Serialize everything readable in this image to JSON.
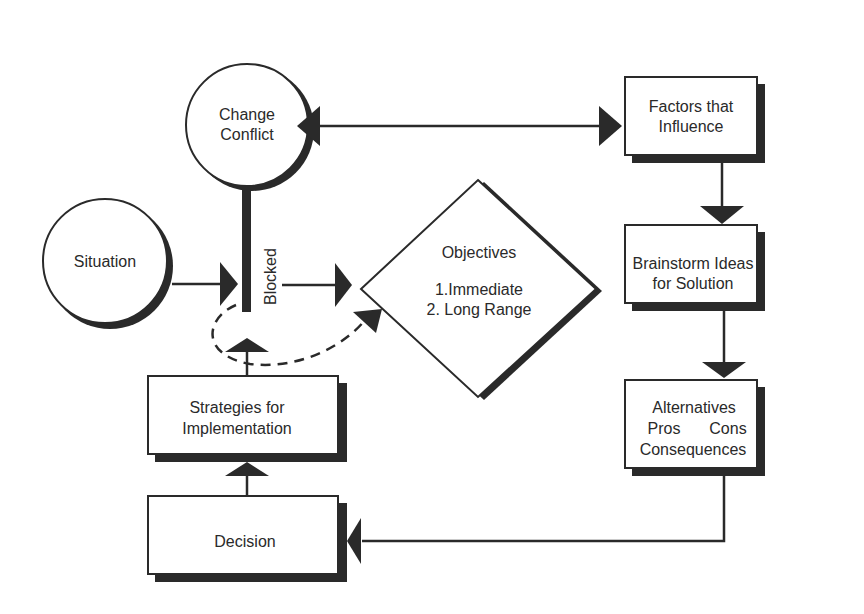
{
  "diagram": {
    "colors": {
      "stroke": "#2a2a2a",
      "shadow": "#2a2a2a",
      "fill": "#ffffff",
      "background": "#ffffff"
    },
    "nodes": {
      "change_conflict": {
        "shape": "circle",
        "lines": [
          "Change",
          "Conflict"
        ]
      },
      "situation": {
        "shape": "circle",
        "lines": [
          "Situation"
        ]
      },
      "objectives": {
        "shape": "diamond",
        "lines": [
          "Objectives",
          "",
          "1.Immediate",
          "2. Long Range"
        ]
      },
      "factors": {
        "shape": "box",
        "lines": [
          "Factors that",
          "Influence"
        ]
      },
      "brainstorm": {
        "shape": "box",
        "lines": [
          "Brainstorm Ideas",
          "for Solution"
        ]
      },
      "alternatives": {
        "shape": "box",
        "lines": [
          "Alternatives",
          "Pros",
          "Cons",
          "Consequences"
        ]
      },
      "strategies": {
        "shape": "box",
        "lines": [
          "Strategies for",
          "Implementation"
        ]
      },
      "decision": {
        "shape": "box",
        "lines": [
          "Decision"
        ]
      }
    },
    "blocked_label": "Blocked",
    "edges": [
      {
        "from": "change_conflict",
        "to": "factors",
        "type": "bidirectional"
      },
      {
        "from": "factors",
        "to": "brainstorm",
        "type": "arrow"
      },
      {
        "from": "brainstorm",
        "to": "alternatives",
        "type": "arrow"
      },
      {
        "from": "alternatives",
        "to": "decision",
        "type": "arrow"
      },
      {
        "from": "decision",
        "to": "strategies",
        "type": "arrow"
      },
      {
        "from": "strategies",
        "to": "blocked",
        "type": "arrow"
      },
      {
        "from": "situation",
        "to": "blocked",
        "type": "arrow"
      },
      {
        "from": "blocked",
        "to": "objectives",
        "type": "arrow"
      },
      {
        "from": "blocked",
        "to": "objectives",
        "type": "dashed-arrow"
      },
      {
        "from": "change_conflict",
        "to": "blocked",
        "type": "bar"
      }
    ]
  }
}
